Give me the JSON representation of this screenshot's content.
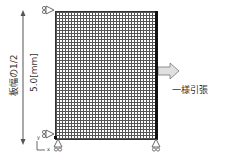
{
  "diagram": {
    "dimension_label": "板幅の1/2",
    "dimension_value": "5.0[mm]",
    "load_label": "一様引張",
    "axes": {
      "x": "x",
      "y": "y"
    },
    "colors": {
      "mesh": "#555555",
      "edge": "#111111",
      "arrow_fill": "#e0e0e0",
      "arrow_stroke": "#777777",
      "text": "#333333"
    }
  }
}
